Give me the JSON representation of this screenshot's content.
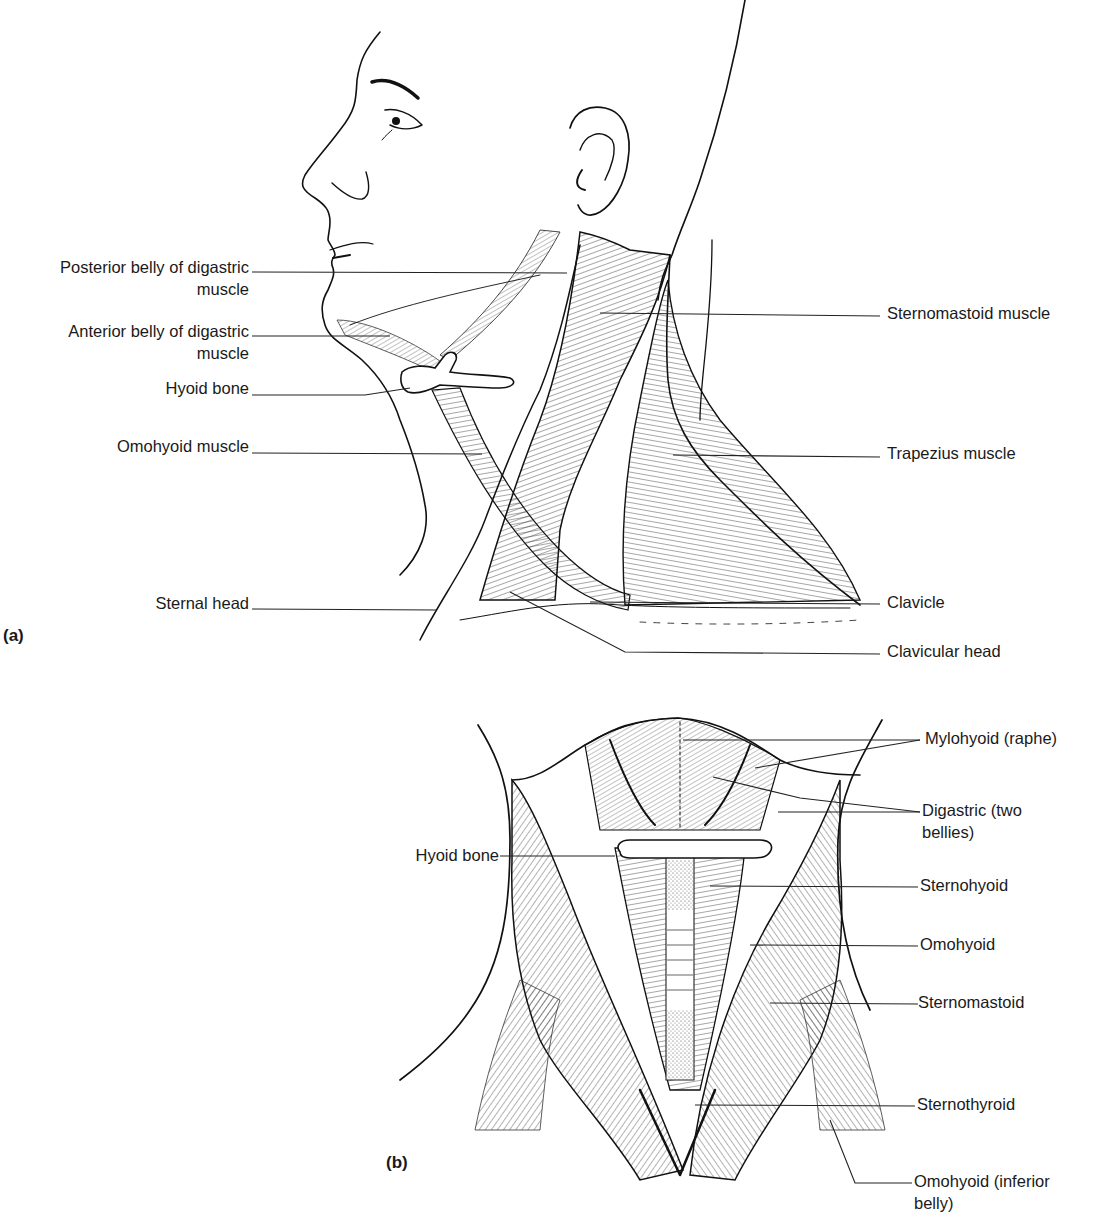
{
  "figure": {
    "panel_a": {
      "tag": "(a)",
      "view": "lateral view of head and neck",
      "labels_left": [
        {
          "id": "posterior-digastric",
          "line1": "Posterior belly of digastric",
          "line2": "muscle"
        },
        {
          "id": "anterior-digastric",
          "line1": "Anterior belly of digastric",
          "line2": "muscle"
        },
        {
          "id": "hyoid-bone",
          "line1": "Hyoid bone"
        },
        {
          "id": "omohyoid",
          "line1": "Omohyoid muscle"
        },
        {
          "id": "sternal-head",
          "line1": "Sternal head"
        }
      ],
      "labels_right": [
        {
          "id": "sternomastoid",
          "line1": "Sternomastoid muscle"
        },
        {
          "id": "trapezius",
          "line1": "Trapezius muscle"
        },
        {
          "id": "clavicle",
          "line1": "Clavicle"
        },
        {
          "id": "clavicular-head",
          "line1": "Clavicular head"
        }
      ]
    },
    "panel_b": {
      "tag": "(b)",
      "view": "anterior view of neck",
      "labels_left": [
        {
          "id": "hyoid-bone",
          "line1": "Hyoid bone"
        }
      ],
      "labels_right": [
        {
          "id": "mylohyoid",
          "line1": "Mylohyoid (raphe)"
        },
        {
          "id": "digastric",
          "line1": "Digastric (two",
          "line2": "bellies)"
        },
        {
          "id": "sternohyoid",
          "line1": "Sternohyoid"
        },
        {
          "id": "omohyoid",
          "line1": "Omohyoid"
        },
        {
          "id": "sternomastoid",
          "line1": "Sternomastoid"
        },
        {
          "id": "sternothyroid",
          "line1": "Sternothyroid"
        },
        {
          "id": "omohyoid-inferior",
          "line1": "Omohyoid (inferior",
          "line2": "belly)"
        }
      ]
    }
  }
}
